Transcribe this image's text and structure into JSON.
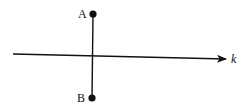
{
  "diagram": {
    "type": "geometry-line-reflection",
    "colors": {
      "stroke": "#111111",
      "background": "#ffffff"
    },
    "line_k": {
      "label": "k",
      "start": [
        13,
        54
      ],
      "end": [
        227,
        59
      ],
      "has_arrow": true
    },
    "segment_AB": {
      "from": "A",
      "to": "B"
    },
    "points": [
      {
        "id": "A",
        "label": "A",
        "x": 93,
        "y": 14
      },
      {
        "id": "B",
        "label": "B",
        "x": 92,
        "y": 98
      }
    ]
  }
}
